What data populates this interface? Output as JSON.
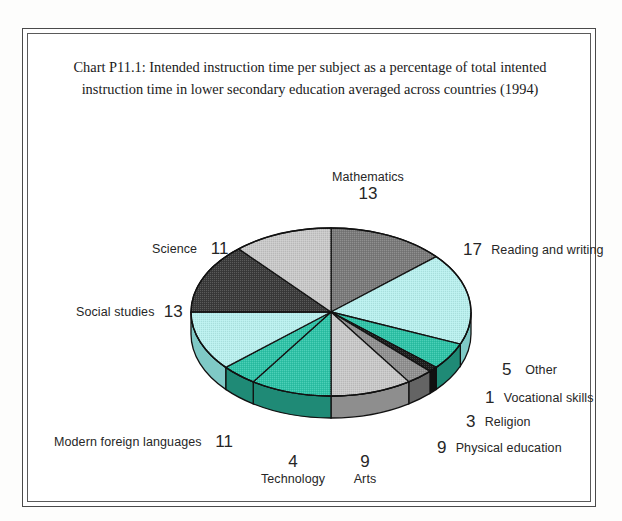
{
  "page": {
    "top_cut_text": "",
    "background_color": "#fdfdfc",
    "frame_border_color": "#4a4a4a"
  },
  "chart": {
    "title_line_1": "Chart P11.1: Intended instruction time per subject as a percentage of total intented",
    "title_line_2": "instruction time in lower secondary education averaged across countries (1994)"
  },
  "chart_data": {
    "type": "pie",
    "title": "Chart P11.1: Intended instruction time per subject as a percentage of total intented instruction time in lower secondary education averaged across countries (1994)",
    "xlabel": "",
    "ylabel": "",
    "unit": "percent",
    "value_total": 96,
    "three_d": true,
    "start_angle_deg": 0,
    "direction": "clockwise",
    "legend": "none",
    "grid": false,
    "labels_inline": true,
    "categories": [
      "Mathematics",
      "Reading and writing",
      "Other",
      "Vocational skills",
      "Religion",
      "Physical education",
      "Arts",
      "Technology",
      "Modern foreign languages",
      "Social studies",
      "Science"
    ],
    "values": [
      13,
      17,
      5,
      1,
      3,
      9,
      9,
      4,
      11,
      13,
      11
    ],
    "colors": [
      "#7a7a7a",
      "#b8f0ee",
      "#2ec4a8",
      "#1c1c1c",
      "#8f8f8f",
      "#c8c8c8",
      "#2ec4a8",
      "#2ec4a8",
      "#b8f0ee",
      "#3a3a3a",
      "#c8c8c8"
    ],
    "slices": [
      {
        "label": "Mathematics",
        "value": 13,
        "color": "#7a7a7a",
        "side_color": "#555555"
      },
      {
        "label": "Reading and writing",
        "value": 17,
        "color": "#b8f0ee",
        "side_color": "#7fc9c6"
      },
      {
        "label": "Other",
        "value": 5,
        "color": "#2ec4a8",
        "side_color": "#1f8a76"
      },
      {
        "label": "Vocational skills",
        "value": 1,
        "color": "#1c1c1c",
        "side_color": "#111111"
      },
      {
        "label": "Religion",
        "value": 3,
        "color": "#8f8f8f",
        "side_color": "#646464"
      },
      {
        "label": "Physical education",
        "value": 9,
        "color": "#c8c8c8",
        "side_color": "#8e8e8e"
      },
      {
        "label": "Arts",
        "value": 9,
        "color": "#2ec4a8",
        "side_color": "#1f8a76"
      },
      {
        "label": "Technology",
        "value": 4,
        "color": "#2ec4a8",
        "side_color": "#1f8a76"
      },
      {
        "label": "Modern foreign languages",
        "value": 11,
        "color": "#b8f0ee",
        "side_color": "#7fc9c6"
      },
      {
        "label": "Social studies",
        "value": 13,
        "color": "#3a3a3a",
        "side_color": "#252525"
      },
      {
        "label": "Science",
        "value": 11,
        "color": "#c8c8c8",
        "side_color": "#8e8e8e"
      }
    ]
  },
  "labels": {
    "mathematics": {
      "name": "Mathematics",
      "value": "13"
    },
    "science": {
      "name": "Science",
      "value": "11"
    },
    "social_studies": {
      "name": "Social studies",
      "value": "13"
    },
    "modern_foreign": {
      "name": "Modern foreign languages",
      "value": "11"
    },
    "technology": {
      "name": "Technology",
      "value": "4"
    },
    "arts": {
      "name": "Arts",
      "value": "9"
    },
    "reading_writing": {
      "name": "Reading and writing",
      "value": "17"
    },
    "other": {
      "name": "Other",
      "value": "5"
    },
    "vocational_skills": {
      "name": "Vocational skills",
      "value": "1"
    },
    "religion": {
      "name": "Religion",
      "value": "3"
    },
    "physical_education": {
      "name": "Physical education",
      "value": "9"
    }
  }
}
